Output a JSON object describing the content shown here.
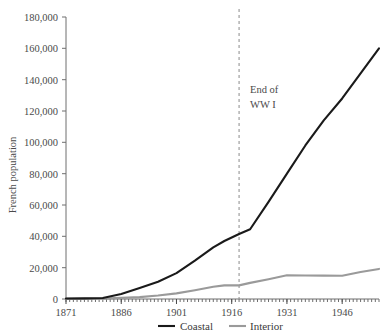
{
  "chart_data": {
    "type": "line",
    "title": "",
    "xlabel": "",
    "ylabel": "French population",
    "xlim": [
      1871,
      1956
    ],
    "ylim": [
      0,
      180000
    ],
    "ytick_labels": [
      "180,000",
      "160,000",
      "140,000",
      "120,000",
      "100,000",
      "80,000",
      "60,000",
      "40,000",
      "20,000",
      "0"
    ],
    "ytick_values": [
      180000,
      160000,
      140000,
      120000,
      100000,
      80000,
      60000,
      40000,
      20000,
      0
    ],
    "xtick_labels": [
      "1871",
      "1886",
      "1901",
      "1916",
      "1931",
      "1946"
    ],
    "xtick_values": [
      1871,
      1886,
      1901,
      1916,
      1931,
      1946
    ],
    "minor_tick_interval": 1,
    "grid": false,
    "legend_position": "bottom",
    "series": [
      {
        "name": "Coastal",
        "color": "#1a1a1a",
        "x": [
          1871,
          1876,
          1881,
          1886,
          1891,
          1896,
          1901,
          1906,
          1911,
          1914,
          1918,
          1921,
          1926,
          1931,
          1936,
          1941,
          1946,
          1951,
          1956
        ],
        "values": [
          300,
          400,
          600,
          3200,
          7000,
          11000,
          16500,
          24500,
          33000,
          37000,
          41500,
          44500,
          62000,
          80000,
          98000,
          114000,
          128000,
          144000,
          160000
        ]
      },
      {
        "name": "Interior",
        "color": "#9a9a9a",
        "x": [
          1871,
          1876,
          1881,
          1886,
          1891,
          1896,
          1901,
          1906,
          1911,
          1914,
          1918,
          1921,
          1926,
          1931,
          1936,
          1941,
          1946,
          1951,
          1956
        ],
        "values": [
          100,
          150,
          250,
          700,
          1200,
          2200,
          3600,
          5600,
          7800,
          8700,
          8700,
          10300,
          12600,
          15100,
          15000,
          14900,
          14800,
          17200,
          19200
        ]
      }
    ],
    "annotations": [
      {
        "name": "end-of-ww1",
        "label_line1": "End of",
        "label_line2": "WW I",
        "x_value": 1918,
        "style": "dashed-vertical-line",
        "color": "#8a8a8a"
      }
    ]
  },
  "legend": {
    "items": [
      {
        "label": "Coastal",
        "color": "#1a1a1a"
      },
      {
        "label": "Interior",
        "color": "#9a9a9a"
      }
    ]
  }
}
